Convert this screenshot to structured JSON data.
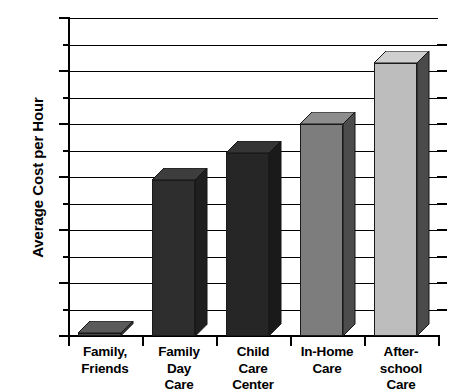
{
  "chart_data": {
    "type": "bar",
    "title": "",
    "subtitle": "",
    "xlabel": "",
    "ylabel": "Average Cost per Hour",
    "categories": [
      "Family, Friends",
      "Family Day Care",
      "Child Care Center",
      "In-Home Care",
      "After-school Care"
    ],
    "category_lines": [
      [
        "Family,",
        "Friends"
      ],
      [
        "Family",
        "Day",
        "Care"
      ],
      [
        "Child",
        "Care",
        "Center"
      ],
      [
        "In-Home",
        "Care"
      ],
      [
        "After-",
        "school",
        "Care"
      ]
    ],
    "values": [
      0.05,
      2.95,
      3.45,
      4.0,
      5.15
    ],
    "ylim": [
      0,
      6
    ],
    "ytick_labels": [
      "$6",
      "5",
      "4",
      "3",
      "2",
      "1",
      "0"
    ],
    "ytick_values": [
      6,
      5,
      4,
      3,
      2,
      1,
      0
    ],
    "minor_tick_values": [
      5.5,
      4.5,
      3.5,
      2.5,
      1.5,
      0.5
    ],
    "grid": true,
    "grid_interval": 0.5,
    "legend": "none",
    "style": "3d-bar",
    "bar_colors": [
      "#4a4a4a",
      "#2e2e2e",
      "#262626",
      "#7d7d7d",
      "#bdbdbd"
    ],
    "bar_top_colors": [
      "#5a5a5a",
      "#3d3d3d",
      "#353535",
      "#8d8d8d",
      "#cfcfcf"
    ],
    "bar_side_colors": [
      "#3a3a3a",
      "#1f1f1f",
      "#1a1a1a",
      "#4c4c4c",
      "#4a4a4a"
    ]
  }
}
